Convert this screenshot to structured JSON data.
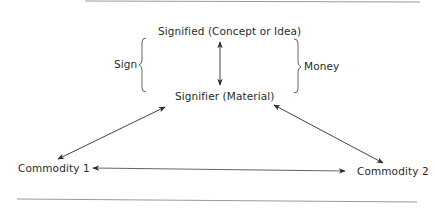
{
  "diagram": {
    "nodes": {
      "signified": "Signified (Concept or Idea)",
      "signifier": "Signifier (Material)",
      "commodity1": "Commodity 1",
      "commodity2": "Commodity 2"
    },
    "brackets": {
      "left": "Sign",
      "right": "Money"
    },
    "edges": [
      {
        "from": "signified",
        "to": "signifier",
        "type": "double-arrow"
      },
      {
        "from": "signifier",
        "to": "commodity1",
        "type": "double-arrow"
      },
      {
        "from": "signifier",
        "to": "commodity2",
        "type": "double-arrow"
      },
      {
        "from": "commodity1",
        "to": "commodity2",
        "type": "double-arrow"
      }
    ],
    "colors": {
      "text": "#2a2a2a",
      "line": "#555555",
      "rule": "#9a9a9a"
    }
  }
}
